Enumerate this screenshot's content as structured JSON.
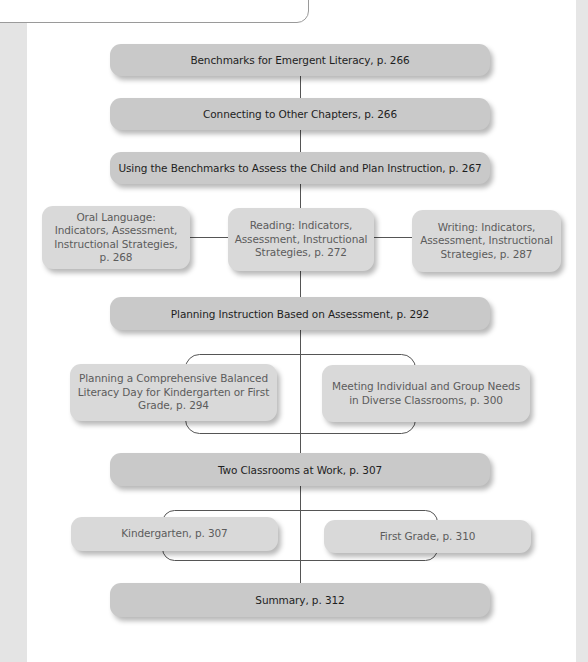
{
  "diagram": {
    "type": "chapter-overview-flowchart",
    "colors": {
      "main_box": "#c9c9c9",
      "sub_box": "#d9d9d9",
      "main_text": "#1e1e1e",
      "sub_text": "#5c5c5c",
      "connector": "#555555",
      "side_strip": "#e4e4e4"
    },
    "main_nodes": [
      {
        "id": "benchmarks",
        "label": "Benchmarks for Emergent Literacy, p. 266"
      },
      {
        "id": "connecting",
        "label": "Connecting to Other Chapters, p. 266"
      },
      {
        "id": "using-benchmarks",
        "label": "Using the Benchmarks to Assess the Child and Plan Instruction, p. 267"
      },
      {
        "id": "planning-instruction",
        "label": "Planning Instruction Based on Assessment, p. 292"
      },
      {
        "id": "two-classrooms",
        "label": "Two Classrooms at Work, p. 307"
      },
      {
        "id": "summary",
        "label": "Summary, p. 312"
      }
    ],
    "sub_nodes": {
      "using_benchmarks": [
        {
          "id": "oral-language",
          "label": "Oral Language: Indicators, Assessment, Instructional Strategies, p. 268"
        },
        {
          "id": "reading",
          "label": "Reading: Indicators, Assessment, Instructional Strategies, p. 272"
        },
        {
          "id": "writing",
          "label": "Writing: Indicators, Assessment, Instructional Strategies, p. 287"
        }
      ],
      "planning_instruction": [
        {
          "id": "balanced-literacy-day",
          "label": "Planning a Comprehensive Balanced Literacy Day for Kindergarten or First Grade, p. 294"
        },
        {
          "id": "meeting-needs",
          "label": "Meeting Individual and Group Needs in Diverse Classrooms, p. 300"
        }
      ],
      "two_classrooms": [
        {
          "id": "kindergarten",
          "label": "Kindergarten, p. 307"
        },
        {
          "id": "first-grade",
          "label": "First Grade, p. 310"
        }
      ]
    }
  }
}
